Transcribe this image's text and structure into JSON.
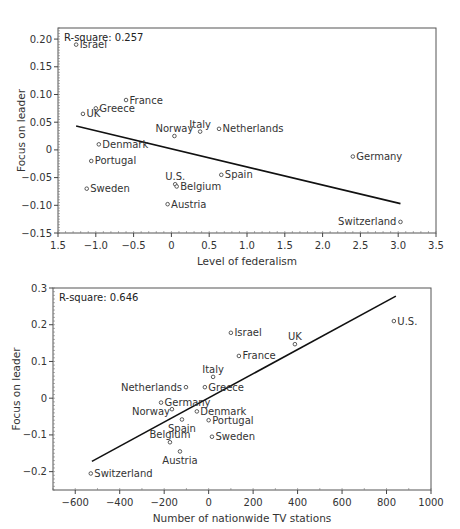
{
  "chart_data": [
    {
      "type": "scatter",
      "title": "",
      "annotation": "R-square: 0.257",
      "xlabel": "Level of federalism",
      "ylabel": "Focus on leader",
      "xlim": [
        -1.5,
        3.5
      ],
      "ylim": [
        -0.15,
        0.22
      ],
      "x_ticks": [
        -1.5,
        -1.0,
        -0.5,
        0,
        0.5,
        1.0,
        1.5,
        2.0,
        2.5,
        3.0,
        3.5
      ],
      "x_tick_labels": [
        "1.5",
        "−1.0",
        "−0.5",
        "0",
        "0.5",
        "1.0",
        "1.5",
        "2.0",
        "2.5",
        "3.0",
        "3.5"
      ],
      "y_ticks": [
        -0.15,
        -0.1,
        -0.05,
        0,
        0.05,
        0.1,
        0.15,
        0.2
      ],
      "y_tick_labels": [
        "−0.15",
        "−0.10",
        "−0.05",
        "0",
        "0.05",
        "0.10",
        "0.15",
        "0.20"
      ],
      "grid": false,
      "points": [
        {
          "label": "Israel",
          "x": -1.26,
          "y": 0.19,
          "pos": "right"
        },
        {
          "label": "France",
          "x": -0.6,
          "y": 0.09,
          "pos": "right"
        },
        {
          "label": "Greece",
          "x": -1.0,
          "y": 0.075,
          "pos": "right"
        },
        {
          "label": "UK",
          "x": -1.17,
          "y": 0.065,
          "pos": "right"
        },
        {
          "label": "Denmark",
          "x": -0.96,
          "y": 0.01,
          "pos": "right"
        },
        {
          "label": "Portugal",
          "x": -1.06,
          "y": -0.02,
          "pos": "right"
        },
        {
          "label": "Sweden",
          "x": -1.12,
          "y": -0.07,
          "pos": "right"
        },
        {
          "label": "Norway",
          "x": 0.04,
          "y": 0.025,
          "pos": "above"
        },
        {
          "label": "Italy",
          "x": 0.38,
          "y": 0.033,
          "pos": "above"
        },
        {
          "label": "Netherlands",
          "x": 0.63,
          "y": 0.038,
          "pos": "right"
        },
        {
          "label": "U.S.",
          "x": 0.05,
          "y": -0.062,
          "pos": "above"
        },
        {
          "label": "Belgium",
          "x": 0.07,
          "y": -0.066,
          "pos": "right"
        },
        {
          "label": "Austria",
          "x": -0.05,
          "y": -0.098,
          "pos": "right"
        },
        {
          "label": "Spain",
          "x": 0.66,
          "y": -0.045,
          "pos": "right"
        },
        {
          "label": "Germany",
          "x": 2.4,
          "y": -0.012,
          "pos": "right"
        },
        {
          "label": "Switzerland",
          "x": 3.03,
          "y": -0.13,
          "pos": "left"
        }
      ],
      "regression_line": {
        "x": [
          -1.26,
          3.03
        ],
        "y": [
          0.043,
          -0.097
        ]
      },
      "frame": {
        "left": 58,
        "top": 28,
        "right": 436,
        "bottom": 233
      }
    },
    {
      "type": "scatter",
      "title": "",
      "annotation": "R-square: 0.646",
      "xlabel": "Number of nationwide TV stations",
      "ylabel": "Focus on leader",
      "xlim": [
        -700,
        1000
      ],
      "ylim": [
        -0.25,
        0.3
      ],
      "x_ticks": [
        -600,
        -400,
        -200,
        0,
        200,
        400,
        600,
        800,
        1000
      ],
      "x_tick_labels": [
        "−600",
        "−400",
        "−200",
        "0",
        "200",
        "400",
        "600",
        "800",
        "1000"
      ],
      "y_ticks": [
        -0.2,
        -0.1,
        0,
        0.1,
        0.2,
        0.3
      ],
      "y_tick_labels": [
        "−0.2",
        "−0.1",
        "0",
        "0.1",
        "0.2",
        "0.3"
      ],
      "grid": false,
      "points": [
        {
          "label": "Switzerland",
          "x": -530,
          "y": -0.205,
          "pos": "right"
        },
        {
          "label": "Austria",
          "x": -129,
          "y": -0.145,
          "pos": "below"
        },
        {
          "label": "Belgium",
          "x": -174,
          "y": -0.12,
          "pos": "above"
        },
        {
          "label": "Spain",
          "x": -120,
          "y": -0.058,
          "pos": "below"
        },
        {
          "label": "Norway",
          "x": -165,
          "y": -0.03,
          "pos": "leftlow"
        },
        {
          "label": "Germany",
          "x": -214,
          "y": -0.012,
          "pos": "right"
        },
        {
          "label": "Denmark",
          "x": -53,
          "y": -0.036,
          "pos": "right"
        },
        {
          "label": "Portugal",
          "x": 0,
          "y": -0.06,
          "pos": "right"
        },
        {
          "label": "Sweden",
          "x": 15,
          "y": -0.105,
          "pos": "right"
        },
        {
          "label": "Netherlands",
          "x": -102,
          "y": 0.03,
          "pos": "left"
        },
        {
          "label": "Greece",
          "x": -17,
          "y": 0.03,
          "pos": "right"
        },
        {
          "label": "Italy",
          "x": 20,
          "y": 0.058,
          "pos": "above"
        },
        {
          "label": "France",
          "x": 136,
          "y": 0.115,
          "pos": "right"
        },
        {
          "label": "Israel",
          "x": 100,
          "y": 0.178,
          "pos": "right"
        },
        {
          "label": "UK",
          "x": 388,
          "y": 0.147,
          "pos": "above"
        },
        {
          "label": "U.S.",
          "x": 833,
          "y": 0.21,
          "pos": "right"
        }
      ],
      "regression_line": {
        "x": [
          -525,
          842
        ],
        "y": [
          -0.172,
          0.278
        ]
      },
      "frame": {
        "left": 53,
        "top": 288,
        "right": 431,
        "bottom": 490
      }
    }
  ]
}
